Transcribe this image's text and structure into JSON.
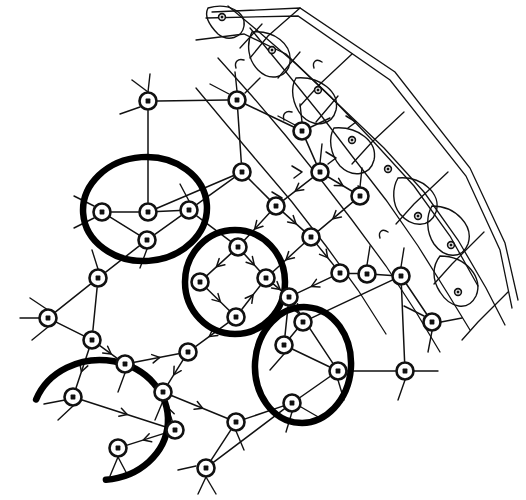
{
  "figure": {
    "caption": "",
    "background_color": "#ffffff",
    "ink_color": "#111111",
    "highlight_color": "#000000",
    "canvas": {
      "width": 526,
      "height": 500
    }
  },
  "style": {
    "node_outer_radius": 8.5,
    "node_inner_radius": 2.4,
    "edge_stroke_width": 1.5,
    "highlight_stroke_width": 6.5,
    "mini_node_radius": 3.4
  },
  "legend": {
    "items": []
  },
  "nodes": [
    {
      "id": "n1",
      "x": 148,
      "y": 101
    },
    {
      "id": "n2",
      "x": 237,
      "y": 100
    },
    {
      "id": "n3",
      "x": 302,
      "y": 131
    },
    {
      "id": "n4",
      "x": 242,
      "y": 172
    },
    {
      "id": "n5",
      "x": 148,
      "y": 212
    },
    {
      "id": "n6",
      "x": 102,
      "y": 212
    },
    {
      "id": "n7",
      "x": 189,
      "y": 210
    },
    {
      "id": "n8",
      "x": 147,
      "y": 240
    },
    {
      "id": "n9",
      "x": 238,
      "y": 247
    },
    {
      "id": "n10",
      "x": 200,
      "y": 282
    },
    {
      "id": "n11",
      "x": 266,
      "y": 278
    },
    {
      "id": "n12",
      "x": 236,
      "y": 317
    },
    {
      "id": "n13",
      "x": 276,
      "y": 206
    },
    {
      "id": "n14",
      "x": 311,
      "y": 237
    },
    {
      "id": "n15",
      "x": 320,
      "y": 172
    },
    {
      "id": "n16",
      "x": 340,
      "y": 273
    },
    {
      "id": "n17",
      "x": 303,
      "y": 322
    },
    {
      "id": "n18",
      "x": 360,
      "y": 196
    },
    {
      "id": "n19",
      "x": 401,
      "y": 276
    },
    {
      "id": "n20",
      "x": 432,
      "y": 322
    },
    {
      "id": "n21",
      "x": 98,
      "y": 278
    },
    {
      "id": "n22",
      "x": 48,
      "y": 318
    },
    {
      "id": "n23",
      "x": 92,
      "y": 340
    },
    {
      "id": "n24",
      "x": 125,
      "y": 364
    },
    {
      "id": "n25",
      "x": 163,
      "y": 392
    },
    {
      "id": "n26",
      "x": 188,
      "y": 352
    },
    {
      "id": "n27",
      "x": 73,
      "y": 397
    },
    {
      "id": "n28",
      "x": 175,
      "y": 430
    },
    {
      "id": "n29",
      "x": 118,
      "y": 448
    },
    {
      "id": "n30",
      "x": 236,
      "y": 422
    },
    {
      "id": "n31",
      "x": 206,
      "y": 468
    },
    {
      "id": "n32",
      "x": 289,
      "y": 297
    },
    {
      "id": "n33",
      "x": 338,
      "y": 371
    },
    {
      "id": "n34",
      "x": 292,
      "y": 403
    },
    {
      "id": "n35",
      "x": 405,
      "y": 371
    },
    {
      "id": "n36",
      "x": 284,
      "y": 345
    },
    {
      "id": "n37",
      "x": 367,
      "y": 274
    }
  ],
  "mini_nodes": [
    {
      "id": "m1",
      "x": 272,
      "y": 50
    },
    {
      "id": "m2",
      "x": 318,
      "y": 90
    },
    {
      "id": "m3",
      "x": 352,
      "y": 140
    },
    {
      "id": "m4",
      "x": 388,
      "y": 169
    },
    {
      "id": "m5",
      "x": 418,
      "y": 216
    },
    {
      "id": "m6",
      "x": 451,
      "y": 245
    },
    {
      "id": "m7",
      "x": 458,
      "y": 292
    },
    {
      "id": "m8",
      "x": 222,
      "y": 17
    }
  ],
  "highlight_groups": [
    {
      "id": "g1",
      "shape": "ellipse",
      "cx": 145,
      "cy": 209,
      "rx": 62,
      "ry": 52,
      "rotation": -4,
      "members": [
        "n5",
        "n6",
        "n7",
        "n8"
      ]
    },
    {
      "id": "g2",
      "shape": "ellipse",
      "cx": 235,
      "cy": 282,
      "rx": 50,
      "ry": 52,
      "rotation": 0,
      "members": [
        "n9",
        "n10",
        "n11",
        "n12"
      ]
    },
    {
      "id": "g3",
      "shape": "ellipse",
      "cx": 303,
      "cy": 365,
      "rx": 48,
      "ry": 58,
      "rotation": 4,
      "members": [
        "n32",
        "n33",
        "n34",
        "n36"
      ]
    },
    {
      "id": "g4",
      "shape": "open-arc",
      "cx": 100,
      "cy": 420,
      "rx": 68,
      "ry": 60,
      "rotation": 0,
      "members": []
    }
  ],
  "edges": [
    {
      "from": "n1",
      "to": "n2",
      "directed": false
    },
    {
      "from": "n2",
      "to": "n3",
      "directed": false
    },
    {
      "from": "n1",
      "to": "n5",
      "directed": false
    },
    {
      "from": "n2",
      "to": "n4",
      "directed": false
    },
    {
      "from": "n4",
      "to": "n5",
      "directed": false
    },
    {
      "from": "n4",
      "to": "n7",
      "directed": false
    },
    {
      "from": "n3",
      "to": "n15",
      "directed": false
    },
    {
      "from": "n5",
      "to": "n6",
      "directed": false
    },
    {
      "from": "n5",
      "to": "n7",
      "directed": false
    },
    {
      "from": "n6",
      "to": "n8",
      "directed": false
    },
    {
      "from": "n7",
      "to": "n8",
      "directed": false
    },
    {
      "from": "n7",
      "to": "n9",
      "directed": false
    },
    {
      "from": "n4",
      "to": "n13",
      "directed": false
    },
    {
      "from": "n13",
      "to": "n9",
      "directed": true
    },
    {
      "from": "n13",
      "to": "n14",
      "directed": true
    },
    {
      "from": "n15",
      "to": "n13",
      "directed": true
    },
    {
      "from": "n15",
      "to": "n18",
      "directed": true
    },
    {
      "from": "n9",
      "to": "n10",
      "directed": true
    },
    {
      "from": "n9",
      "to": "n11",
      "directed": true
    },
    {
      "from": "n10",
      "to": "n12",
      "directed": true
    },
    {
      "from": "n12",
      "to": "n11",
      "directed": true
    },
    {
      "from": "n14",
      "to": "n11",
      "directed": true
    },
    {
      "from": "n14",
      "to": "n16",
      "directed": true
    },
    {
      "from": "n18",
      "to": "n14",
      "directed": true
    },
    {
      "from": "n16",
      "to": "n32",
      "directed": true
    },
    {
      "from": "n11",
      "to": "n32",
      "directed": true
    },
    {
      "from": "n32",
      "to": "n17",
      "directed": true
    },
    {
      "from": "n16",
      "to": "n37",
      "directed": false
    },
    {
      "from": "n37",
      "to": "n19",
      "directed": false
    },
    {
      "from": "n19",
      "to": "n20",
      "directed": false
    },
    {
      "from": "n8",
      "to": "n21",
      "directed": false
    },
    {
      "from": "n21",
      "to": "n22",
      "directed": false
    },
    {
      "from": "n21",
      "to": "n23",
      "directed": false
    },
    {
      "from": "n22",
      "to": "n23",
      "directed": false
    },
    {
      "from": "n23",
      "to": "n24",
      "directed": true
    },
    {
      "from": "n23",
      "to": "n27",
      "directed": true
    },
    {
      "from": "n24",
      "to": "n26",
      "directed": true
    },
    {
      "from": "n12",
      "to": "n26",
      "directed": true
    },
    {
      "from": "n26",
      "to": "n25",
      "directed": true
    },
    {
      "from": "n25",
      "to": "n30",
      "directed": true
    },
    {
      "from": "n27",
      "to": "n28",
      "directed": true
    },
    {
      "from": "n28",
      "to": "n25",
      "directed": true
    },
    {
      "from": "n28",
      "to": "n29",
      "directed": true
    },
    {
      "from": "n30",
      "to": "n31",
      "directed": false
    },
    {
      "from": "n30",
      "to": "n34",
      "directed": false
    },
    {
      "from": "n31",
      "to": "n34",
      "directed": false
    },
    {
      "from": "n36",
      "to": "n33",
      "directed": false
    },
    {
      "from": "n33",
      "to": "n34",
      "directed": false
    },
    {
      "from": "n32",
      "to": "n36",
      "directed": false
    },
    {
      "from": "n32",
      "to": "n33",
      "directed": false
    },
    {
      "from": "n17",
      "to": "n36",
      "directed": false
    },
    {
      "from": "n33",
      "to": "n35",
      "directed": false
    },
    {
      "from": "n17",
      "to": "n19",
      "directed": false
    },
    {
      "from": "n19",
      "to": "n35",
      "directed": false
    }
  ],
  "annotations": {
    "node_glyph": "circle-with-dot",
    "edge_glyph": "line-with-midpoint-arrow",
    "highlight_glyph": "bold-ellipse"
  }
}
